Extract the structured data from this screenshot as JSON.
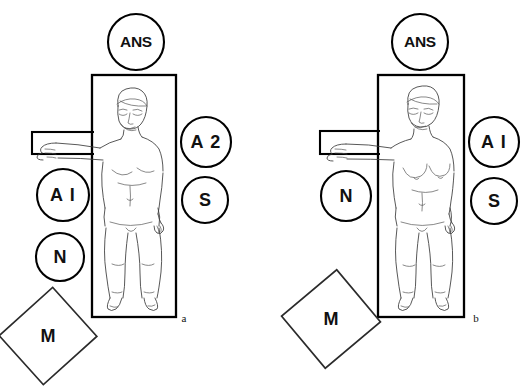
{
  "figure": {
    "background_color": "#ffffff",
    "line_color": "#000000",
    "body_outline_color": "#3a3a3a"
  },
  "panels": [
    {
      "id": "panel-a",
      "letter": "a",
      "table_label": "patient-table",
      "armboard_label": "arm-board",
      "subject": "male-supine-figure",
      "equipment": [
        {
          "name": "ans-circle",
          "label": "ANS",
          "shape": "circle",
          "position": "top"
        },
        {
          "name": "a1-circle",
          "label": "A I",
          "shape": "circle",
          "position": "left-upper"
        },
        {
          "name": "n-circle",
          "label": "N",
          "shape": "circle",
          "position": "left-lower"
        },
        {
          "name": "a2-circle",
          "label": "A 2",
          "shape": "circle",
          "position": "right-upper"
        },
        {
          "name": "s-circle",
          "label": "S",
          "shape": "circle",
          "position": "right-lower"
        },
        {
          "name": "m-square",
          "label": "M",
          "shape": "rotated-square",
          "position": "bottom-left"
        }
      ]
    },
    {
      "id": "panel-b",
      "letter": "b",
      "table_label": "patient-table",
      "armboard_label": "arm-board",
      "subject": "female-supine-figure",
      "equipment": [
        {
          "name": "ans-circle",
          "label": "ANS",
          "shape": "circle",
          "position": "top"
        },
        {
          "name": "n-circle",
          "label": "N",
          "shape": "circle",
          "position": "left-middle"
        },
        {
          "name": "a1-circle",
          "label": "A I",
          "shape": "circle",
          "position": "right-upper"
        },
        {
          "name": "s-circle",
          "label": "S",
          "shape": "circle",
          "position": "right-lower"
        },
        {
          "name": "m-square",
          "label": "M",
          "shape": "rotated-square",
          "position": "bottom-left"
        }
      ]
    }
  ]
}
